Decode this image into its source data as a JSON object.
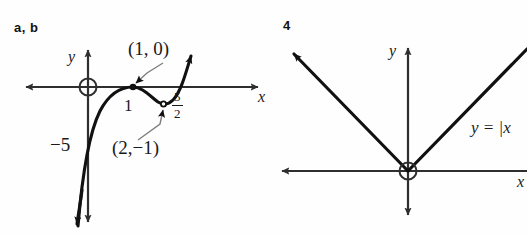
{
  "figure": {
    "panels": [
      {
        "tag": "a, b",
        "graph_kind": "cubic-curve",
        "axis_labels": {
          "x": "x",
          "y": "y"
        },
        "origin_marker": "circle-open",
        "annotations": [
          {
            "name": "point-1-0",
            "text": "(1, 0)"
          },
          {
            "name": "tick-1",
            "text": "1"
          },
          {
            "name": "tick-5-over-2",
            "numerator": "5",
            "denominator": "2"
          },
          {
            "name": "intercept-minus-5",
            "text": "−5"
          },
          {
            "name": "point-2-minus-1",
            "text": "(2,−1)"
          }
        ]
      },
      {
        "tag": "4",
        "graph_kind": "absolute-value-v",
        "axis_labels": {
          "x": "x",
          "y": "y"
        },
        "origin_marker": "circle-open",
        "annotations": [
          {
            "name": "equation-label",
            "text": "y = |x"
          }
        ]
      }
    ],
    "colors": {
      "curve": "#111111",
      "axis": "#3a3a3a",
      "text": "#1a1a1a",
      "background": "#fefefe",
      "leader": "#8a8a8a"
    }
  }
}
